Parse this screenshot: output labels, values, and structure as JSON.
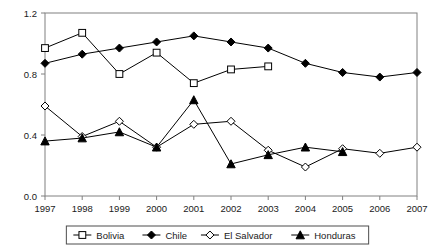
{
  "chart_data": {
    "type": "line",
    "title": "",
    "xlabel": "",
    "ylabel": "",
    "categories": [
      "1997",
      "1998",
      "1999",
      "2000",
      "2001",
      "2002",
      "2003",
      "2004",
      "2005",
      "2006",
      "2007"
    ],
    "x": [
      1997,
      1998,
      1999,
      2000,
      2001,
      2002,
      2003,
      2004,
      2005,
      2006,
      2007
    ],
    "ylim": [
      0.0,
      1.2
    ],
    "xlim": [
      1997,
      2007
    ],
    "yticks": [
      0.0,
      0.4,
      0.8,
      1.2
    ],
    "ytick_labels": [
      "0.0",
      "0.4",
      "0.8",
      "1.2"
    ],
    "xtick_labels": [
      "1997",
      "1998",
      "1999",
      "2000",
      "2001",
      "2002",
      "2003",
      "2004",
      "2005",
      "2006",
      "2007"
    ],
    "grid": false,
    "legend_position": "bottom",
    "series": [
      {
        "name": "Bolivia",
        "marker": "open-square",
        "color": "#000000",
        "values": [
          0.97,
          1.07,
          0.8,
          0.94,
          0.74,
          0.83,
          0.85,
          null,
          null,
          null,
          null
        ]
      },
      {
        "name": "Chile",
        "marker": "filled-diamond",
        "color": "#000000",
        "values": [
          0.87,
          0.93,
          0.97,
          1.01,
          1.05,
          1.01,
          0.97,
          0.87,
          0.81,
          0.78,
          0.81
        ]
      },
      {
        "name": "El Salvador",
        "marker": "open-diamond",
        "color": "#000000",
        "values": [
          0.59,
          0.39,
          0.49,
          0.32,
          0.47,
          0.49,
          0.3,
          0.19,
          0.31,
          0.28,
          0.32
        ]
      },
      {
        "name": "Honduras",
        "marker": "filled-triangle",
        "color": "#000000",
        "values": [
          0.36,
          0.38,
          0.42,
          0.32,
          0.63,
          0.21,
          0.27,
          0.32,
          0.29,
          null,
          null
        ]
      }
    ]
  },
  "legend": {
    "items": [
      {
        "label": "Bolivia",
        "marker": "open-square"
      },
      {
        "label": "Chile",
        "marker": "filled-diamond"
      },
      {
        "label": "El Salvador",
        "marker": "open-diamond"
      },
      {
        "label": "Honduras",
        "marker": "filled-triangle"
      }
    ]
  },
  "axes": {
    "y_labels": [
      "1.2",
      "0.8",
      "0.4",
      "0.0"
    ],
    "x_labels": [
      "1997",
      "1998",
      "1999",
      "2000",
      "2001",
      "2002",
      "2003",
      "2004",
      "2005",
      "2006",
      "2007"
    ]
  }
}
